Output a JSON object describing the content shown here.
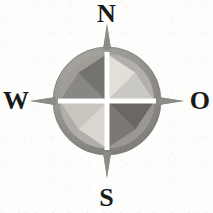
{
  "figure": {
    "name": "compass-rose",
    "kind": "compass-rose-illustration",
    "background_color": "#fdfdfc"
  },
  "labels": {
    "north": "N",
    "west": "W",
    "east": "O",
    "south": "S",
    "text_color": "#1a1a1a"
  },
  "ring": {
    "center_x": 107,
    "center_y": 101,
    "outer_radius": 54,
    "inner_radius": 47,
    "fill_color": "#989692",
    "shadow_color": "#7e7c78",
    "highlight_color": "#b3b0ab"
  },
  "star": {
    "points": 8,
    "cardinal_radius": 47,
    "diagonal_radius": 40,
    "waist_radius": 12,
    "colors": {
      "dark": "#6f6d6a",
      "mid_dark": "#85837f",
      "mid": "#97958f",
      "light": "#b8b5ae",
      "lighter": "#cfccc5",
      "pale": "#dedbd4"
    }
  },
  "cross": {
    "color": "#ffffff",
    "thickness": 5,
    "orientation": "vertical-and-horizontal"
  },
  "spikes": {
    "color": "#9b9994",
    "tip_color": "#86847f",
    "length_beyond_ring": 15,
    "directions": [
      "north",
      "east",
      "south",
      "west"
    ]
  },
  "quadrant_shading": {
    "top_left": "mid",
    "top_right": "light",
    "bottom_left": "light",
    "bottom_right": "dark"
  }
}
